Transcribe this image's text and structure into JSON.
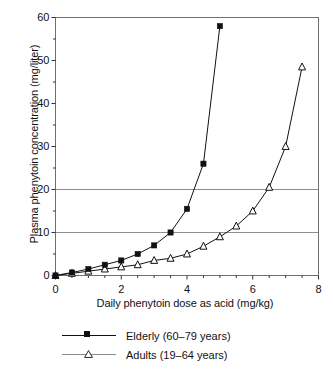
{
  "chart_data": {
    "type": "line",
    "title": "",
    "xlabel": "Daily phenytoin dose as acid (mg/kg)",
    "ylabel": "Plasma phenytoin concentration (mg/liter)",
    "xlim": [
      0,
      8
    ],
    "ylim": [
      0,
      60
    ],
    "xticks": [
      0,
      2,
      4,
      6,
      8
    ],
    "xtick_labels": [
      "0",
      "2",
      "4",
      "6",
      "8"
    ],
    "xminor_step": 0.5,
    "yticks": [
      0,
      10,
      20,
      30,
      40,
      50,
      60
    ],
    "ytick_labels": [
      "0",
      "10",
      "20",
      "30",
      "40",
      "50",
      "60"
    ],
    "yminor_step": 5,
    "grid": "horizontal gridlines at 10 and 20",
    "gridlines_y": [
      10,
      20
    ],
    "legend_position": "below plot, centered",
    "series": [
      {
        "name": "Elderly (60–79 years)",
        "marker": "filled-square",
        "color": "#111111",
        "x": [
          0,
          0.5,
          1,
          1.5,
          2,
          2.5,
          3,
          3.5,
          4,
          4.5,
          5
        ],
        "values": [
          0,
          0.7,
          1.5,
          2.5,
          3.5,
          5,
          7,
          10,
          15.5,
          26,
          58
        ]
      },
      {
        "name": "Adults (19–64 years)",
        "marker": "open-triangle",
        "color": "#111111",
        "x": [
          0,
          0.5,
          1,
          1.5,
          2,
          2.5,
          3,
          3.5,
          4,
          4.5,
          5,
          5.5,
          6,
          6.5,
          7,
          7.5
        ],
        "values": [
          0,
          0.5,
          1,
          1.5,
          2,
          2.5,
          3.5,
          4,
          5,
          6.8,
          9,
          11.5,
          15,
          20.5,
          30,
          48.5
        ]
      }
    ]
  },
  "axes": {
    "y_title": "Plasma phenytoin concentration (mg/liter)",
    "x_title": "Daily phenytoin dose as acid (mg/kg)"
  },
  "legend": {
    "items": [
      {
        "label": "Elderly (60–79 years)",
        "marker": "filled-square",
        "line_color": "#111111"
      },
      {
        "label": "Adults (19–64 years)",
        "marker": "open-triangle",
        "line_color": "#8b8b8b"
      }
    ]
  }
}
